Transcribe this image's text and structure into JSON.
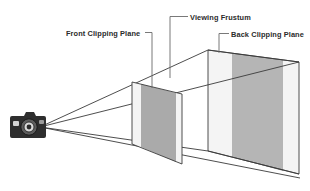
{
  "diagram": {
    "labels": {
      "front_clipping_plane": "Front Clipping Plane",
      "viewing_frustum": "Viewing Frustum",
      "back_clipping_plane": "Back Clipping Plane"
    },
    "icons": {
      "camera": "camera-icon"
    },
    "colors": {
      "stroke": "#3a3a3a",
      "leader": "#6a6a6a",
      "plane_mid_gray": "#aaaaaa",
      "plane_light_gray": "#f2f2f2",
      "back_band_gray": "#b5b5b5",
      "camera_body": "#2e2e2e",
      "background": "#ffffff"
    },
    "geometry": {
      "apex": [
        40,
        127
      ],
      "front_plane_x_range": [
        132,
        182
      ],
      "back_plane_x_range": [
        208,
        299
      ],
      "bottom_right_vanish": [
        300,
        178
      ]
    }
  }
}
